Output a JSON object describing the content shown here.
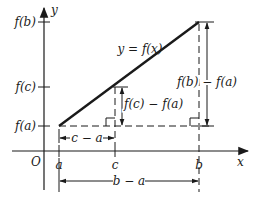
{
  "diagram": {
    "axes": {
      "x_label": "x",
      "y_label": "y",
      "origin_label": "O"
    },
    "x_ticks": [
      {
        "label": "a"
      },
      {
        "label": "c"
      },
      {
        "label": "b"
      }
    ],
    "y_ticks": [
      {
        "label": "f(b)"
      },
      {
        "label": "f(c)"
      },
      {
        "label": "f(a)"
      }
    ],
    "curve_label": "y = f(x)",
    "dimensions": {
      "c_minus_a": "c − a",
      "b_minus_a": "b − a",
      "fc_minus_fa": "f(c) − f(a)",
      "fb_minus_fa": "f(b) − f(a)"
    },
    "colors": {
      "ink": "#1a1a1a",
      "background": "#ffffff"
    }
  }
}
